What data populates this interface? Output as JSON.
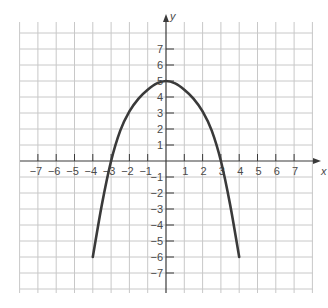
{
  "chart_data": {
    "type": "line",
    "title": "",
    "xlabel": "x",
    "ylabel": "y",
    "xlim": [
      -8,
      8
    ],
    "ylim": [
      -8.5,
      8.5
    ],
    "grid": true,
    "x_ticks": [
      -7,
      -6,
      -5,
      -4,
      -3,
      -2,
      -1,
      1,
      2,
      3,
      4,
      5,
      6,
      7
    ],
    "y_ticks": [
      7,
      6,
      5,
      4,
      3,
      2,
      1,
      -1,
      -2,
      -3,
      -4,
      -5,
      -6,
      -7
    ],
    "x_tick_labels": [
      "−7",
      "−6",
      "−5",
      "−4",
      "−3",
      "−2",
      "−1",
      "1",
      "2",
      "3",
      "4",
      "5",
      "6",
      "7"
    ],
    "y_tick_labels": [
      "7",
      "6",
      "5",
      "4",
      "3",
      "2",
      "1",
      "−1",
      "−2",
      "−3",
      "−4",
      "−5",
      "−6",
      "−7"
    ],
    "series": [
      {
        "name": "parabola",
        "description": "downward-opening parabola, vertex (0,5), x-intercepts near ±3, endpoints (±4,−6)",
        "color": "#3a3a3a",
        "x": [
          -4,
          -3.5,
          -3,
          -2.5,
          -2,
          -1.5,
          -1,
          -0.5,
          0,
          0.5,
          1,
          1.5,
          2,
          2.5,
          3,
          3.5,
          4
        ],
        "y": [
          -6,
          -2.7,
          0,
          1.9,
          3.1,
          3.9,
          4.45,
          4.85,
          5,
          4.85,
          4.45,
          3.9,
          3.1,
          1.9,
          0,
          -2.7,
          -6
        ]
      }
    ]
  },
  "colors": {
    "grid": "#c8c8c8",
    "axis": "#3a3a3a",
    "curve": "#3a3a3a",
    "label": "#4a4a4a"
  }
}
